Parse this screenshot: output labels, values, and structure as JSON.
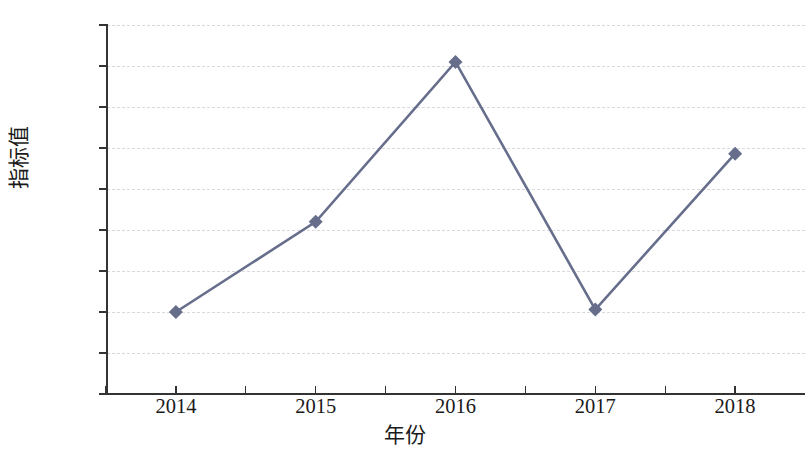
{
  "chart_data": {
    "type": "line",
    "title": "",
    "xlabel": "年份",
    "ylabel": "指标值",
    "categories": [
      "2014",
      "2015",
      "2016",
      "2017",
      "2018"
    ],
    "x": [
      2014,
      2015,
      2016,
      2017,
      2018
    ],
    "values": [
      100.0,
      101.1,
      103.05,
      100.03,
      101.93
    ],
    "series": [
      {
        "name": "指标值",
        "values": [
          100.0,
          101.1,
          103.05,
          100.03,
          101.93
        ]
      }
    ],
    "ylim": [
      99,
      103.5
    ],
    "xlim": [
      2013.5,
      2018.5
    ],
    "yticks": [
      "99",
      "99.5",
      "100",
      "100.5",
      "101",
      "101.5",
      "102",
      "102.5",
      "103",
      "103.5"
    ],
    "ytick_values": [
      99,
      99.5,
      100,
      100.5,
      101,
      101.5,
      102,
      102.5,
      103,
      103.5
    ],
    "xticks": [
      "2014",
      "2015",
      "2016",
      "2017",
      "2018"
    ],
    "grid": "horizontal-dashed",
    "legend": "none",
    "marker": "diamond",
    "series_color": "#666e8c",
    "grid_color": "#d9d9dd",
    "axis_color": "#333333"
  }
}
